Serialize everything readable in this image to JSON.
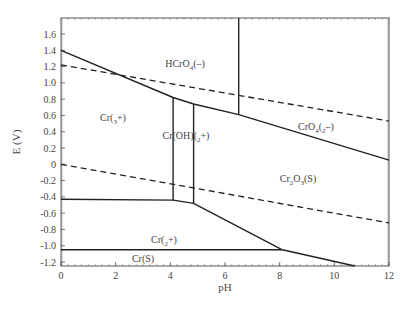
{
  "chart_data": {
    "type": "line",
    "title": "",
    "subtitle": "Pourbaix (E-pH) diagram for chromium",
    "xlabel": "pH",
    "ylabel": "E (V)",
    "xlim": [
      0,
      12
    ],
    "ylim": [
      -1.25,
      1.8
    ],
    "grid": false,
    "legend": "none",
    "x_ticks": [
      "0",
      "2",
      "4",
      "6",
      "8",
      "10",
      "12"
    ],
    "y_ticks": [
      "1.6",
      "1.4",
      "1.2",
      "1.0",
      "0.8",
      "0.6",
      "0.4",
      "0.2",
      "0",
      "-0.2",
      "-0.4",
      "-0.6",
      "-0.8",
      "-1.0",
      "-1.2"
    ],
    "series": [
      {
        "name": "Cr(3+)/HCrO4(-) boundary",
        "style": "solid",
        "x": [
          0,
          4.1,
          4.85,
          6.5,
          12
        ],
        "y": [
          1.4,
          0.82,
          0.74,
          0.61,
          0.05
        ]
      },
      {
        "name": "Cr(3+)/Cr(OH)(2+) boundary",
        "style": "solid",
        "x": [
          4.1,
          4.1
        ],
        "y": [
          0.82,
          -0.44
        ]
      },
      {
        "name": "Cr(OH)(2+)/Cr2O3(S) boundary",
        "style": "solid",
        "x": [
          4.85,
          4.85
        ],
        "y": [
          0.74,
          -0.48
        ]
      },
      {
        "name": "HCrO4(-)/CrO4(2-) boundary",
        "style": "solid",
        "x": [
          6.5,
          6.5
        ],
        "y": [
          1.8,
          0.61
        ]
      },
      {
        "name": "Cr(3+)/Cr(2+) boundary",
        "style": "solid",
        "x": [
          0,
          4.1,
          4.85,
          8.1
        ],
        "y": [
          -0.43,
          -0.44,
          -0.48,
          -1.05
        ]
      },
      {
        "name": "Cr(2+)/Cr(S) boundary",
        "style": "solid",
        "x": [
          0,
          8.1
        ],
        "y": [
          -1.05,
          -1.05
        ]
      },
      {
        "name": "Cr2O3(S)/Cr(S) boundary",
        "style": "solid",
        "x": [
          8.1,
          10.75
        ],
        "y": [
          -1.05,
          -1.25
        ]
      },
      {
        "name": "O2/H2O (water upper limit)",
        "style": "dashed",
        "x": [
          0,
          12
        ],
        "y": [
          1.22,
          0.53
        ]
      },
      {
        "name": "H2O/H2 (water lower limit)",
        "style": "dashed",
        "x": [
          0,
          12
        ],
        "y": [
          0.0,
          -0.72
        ]
      }
    ],
    "annotations": [
      {
        "text": "HCrO4(–)",
        "x": 4.6,
        "y": 1.28
      },
      {
        "text": "CrO4(2–)",
        "x": 9.3,
        "y": 0.86
      },
      {
        "text": "Cr(3+)",
        "x": 1.6,
        "y": 0.6
      },
      {
        "text": "Cr(OH)(2+)",
        "x": 5.0,
        "y": 0.3
      },
      {
        "text": "Cr2O3(S)",
        "x": 9.0,
        "y": -0.2
      },
      {
        "text": "Cr(2+)",
        "x": 4.5,
        "y": -0.88
      },
      {
        "text": "Cr(S)",
        "x": 3.0,
        "y": -1.12
      }
    ]
  },
  "axes": {
    "x_label": "pH",
    "y_label": "E (V)"
  },
  "labels": {
    "hcro4": {
      "main": "HCrO",
      "sub": "4",
      "tail": "(–)"
    },
    "cro4": {
      "main": "CrO",
      "sub": "4",
      "mid": "(",
      "sub2": "2",
      "tail": "–)"
    },
    "cr3": {
      "main": "Cr(",
      "sub": "3",
      "tail": "+)"
    },
    "croh": {
      "main": "Cr(OH)(",
      "sub": "2",
      "tail": "+)"
    },
    "cr2o3": {
      "main": "Cr",
      "sub": "2",
      "mid": "O",
      "sub2": "3",
      "tail": "(S)"
    },
    "cr2": {
      "main": "Cr(",
      "sub": "2",
      "tail": "+)"
    },
    "crs": {
      "main": "Cr(S)"
    }
  }
}
